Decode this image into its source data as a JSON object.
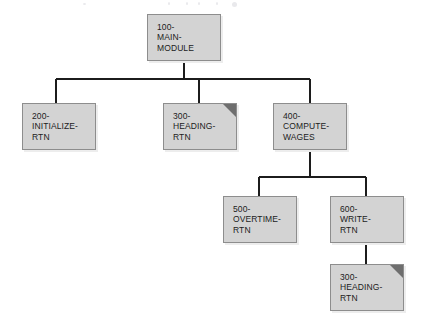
{
  "diagram": {
    "type": "structure-chart",
    "canvas": {
      "width": 421,
      "height": 323,
      "background": "#ffffff"
    },
    "style": {
      "box_fill": "#d3d3d3",
      "box_border": "#8d8d8d",
      "box_shadow": "#ededed",
      "connector_color": "#1c1c1c",
      "fold_color": "#6e6e6e",
      "text_color": "#1c1c1c"
    },
    "nodes": [
      {
        "id": "100",
        "label": "100-\nMAIN-\nMODULE",
        "number": "100",
        "name": "MAIN-MODULE",
        "level": 0,
        "x": 147,
        "y": 14,
        "w": 74,
        "h": 47,
        "duplicate_marker": false
      },
      {
        "id": "200",
        "label": "200-\nINITIALIZE-\nRTN",
        "number": "200",
        "name": "INITIALIZE-RTN",
        "level": 1,
        "x": 22,
        "y": 103,
        "w": 74,
        "h": 47,
        "duplicate_marker": false
      },
      {
        "id": "300a",
        "label": "300-\nHEADING-\nRTN",
        "number": "300",
        "name": "HEADING-RTN",
        "level": 1,
        "x": 163,
        "y": 103,
        "w": 74,
        "h": 47,
        "duplicate_marker": true
      },
      {
        "id": "400",
        "label": "400-\nCOMPUTE-\nWAGES",
        "number": "400",
        "name": "COMPUTE-WAGES",
        "level": 1,
        "x": 273,
        "y": 103,
        "w": 74,
        "h": 47,
        "duplicate_marker": false
      },
      {
        "id": "500",
        "label": "500-\nOVERTIME-\nRTN",
        "number": "500",
        "name": "OVERTIME-RTN",
        "level": 2,
        "x": 223,
        "y": 196,
        "w": 74,
        "h": 47,
        "duplicate_marker": false
      },
      {
        "id": "600",
        "label": "600-\nWRITE-\nRTN",
        "number": "600",
        "name": "WRITE-RTN",
        "level": 2,
        "x": 330,
        "y": 196,
        "w": 74,
        "h": 47,
        "duplicate_marker": false
      },
      {
        "id": "300b",
        "label": "300-\nHEADING-\nRTN",
        "number": "300",
        "name": "HEADING-RTN",
        "level": 3,
        "x": 330,
        "y": 264,
        "w": 74,
        "h": 47,
        "duplicate_marker": true
      }
    ],
    "edges": [
      {
        "from": "100",
        "to": "200",
        "style": "elbow"
      },
      {
        "from": "100",
        "to": "300a",
        "style": "elbow"
      },
      {
        "from": "100",
        "to": "400",
        "style": "elbow"
      },
      {
        "from": "400",
        "to": "500",
        "style": "elbow"
      },
      {
        "from": "400",
        "to": "600",
        "style": "elbow"
      },
      {
        "from": "600",
        "to": "300b",
        "style": "straight"
      }
    ],
    "connectors": {
      "bus_1": {
        "y": 79,
        "x_start": 56,
        "x_end": 310,
        "stem_x": 184,
        "stem_top": 61
      },
      "bus_2": {
        "y": 177,
        "x_start": 259,
        "x_end": 366,
        "stem_x": 310,
        "stem_top": 150
      },
      "drop_600_300b": {
        "x": 366,
        "y_start": 243,
        "y_end": 264
      }
    }
  }
}
